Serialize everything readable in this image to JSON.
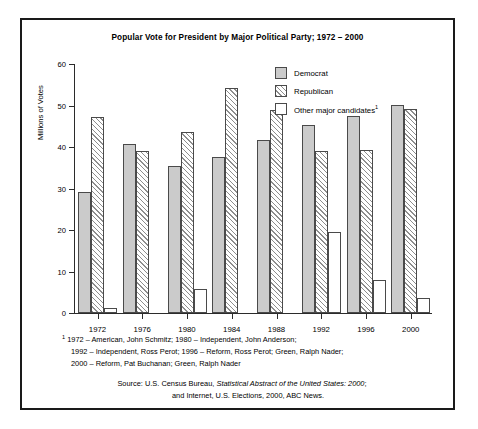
{
  "chart_data": {
    "type": "bar",
    "title": "Popular Vote for President by Major Political Party; 1972 – 2000",
    "xlabel": "",
    "ylabel": "Millions of Votes",
    "ylim": [
      0,
      60
    ],
    "yticks": [
      0,
      10,
      20,
      30,
      40,
      50,
      60
    ],
    "grid": false,
    "legend_position": "upper right",
    "categories": [
      "1972",
      "1976",
      "1980",
      "1984",
      "1988",
      "1992",
      "1996",
      "2000"
    ],
    "series": [
      {
        "name": "Democrat",
        "color": "#cbcbcb",
        "values": [
          29.2,
          40.8,
          35.5,
          37.6,
          41.8,
          45.3,
          47.4,
          50.2
        ]
      },
      {
        "name": "Republican",
        "color": "#ffffff",
        "pattern": "diagonal-hatch",
        "values": [
          47.2,
          39.1,
          43.6,
          54.2,
          48.9,
          39.1,
          39.2,
          49.2
        ]
      },
      {
        "name": "Other major candidates",
        "color": "#ffffff",
        "values": [
          1.1,
          0,
          5.7,
          0,
          0,
          19.5,
          8.0,
          3.7
        ]
      }
    ]
  },
  "figure": {
    "title": "Popular Vote for President by Major Political Party; 1972 – 2000",
    "axis": {
      "ylabel": "Millions of Votes",
      "yticks": [
        "0",
        "10",
        "20",
        "30",
        "40",
        "50",
        "60"
      ],
      "xticks": [
        "1972",
        "1976",
        "1980",
        "1984",
        "1988",
        "1992",
        "1996",
        "2000"
      ]
    },
    "legend": {
      "items": [
        {
          "label": "Democrat",
          "swatch": "solid-gray-swatch"
        },
        {
          "label": "Republican",
          "swatch": "hatched-swatch"
        },
        {
          "label": "Other major candidates",
          "superscript": "1",
          "swatch": "white-swatch"
        }
      ]
    },
    "footnote": {
      "marker": "1",
      "lines": [
        "1972 – American, John Schmitz; 1980 – Independent, John Anderson;",
        "1992 – Independent, Ross Perot; 1996 – Reform, Ross Perot; Green, Ralph Nader;",
        "2000 – Reform, Pat Buchanan; Green, Ralph Nader"
      ]
    },
    "source": {
      "line1_prefix": "Source: U.S. Census Bureau, ",
      "line1_italic": "Statistical Abstract of the United States: 2000",
      "line1_suffix": ";",
      "line2": "and Internet, U.S. Elections, 2000, ABC News."
    }
  }
}
